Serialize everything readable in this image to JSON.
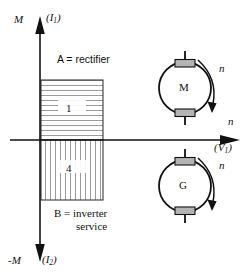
{
  "figure": {
    "type": "four-quadrant-operation-diagram",
    "background_color": "#ffffff",
    "stroke_color": "#111111",
    "hatch_color": "#9a9a9a",
    "terminal_fill": "#b4b4b4"
  },
  "axes": {
    "vertical_positive": {
      "symbol": "M",
      "paren": "(I",
      "subscript": "1",
      "paren_close": ")"
    },
    "vertical_negative": {
      "symbol": "-M",
      "paren": "(I",
      "subscript": "2",
      "paren_close": ")"
    },
    "horizontal_positive": {
      "symbol": "n",
      "paren": "(V",
      "subscript": "1",
      "paren_close": ")"
    }
  },
  "quadrants": [
    {
      "number": "1",
      "hatch": "horizontal",
      "caption_key": "rectifier"
    },
    {
      "number": "4",
      "hatch": "vertical",
      "caption_key": "inverter"
    }
  ],
  "captions": {
    "rectifier": "A = rectifier",
    "inverter_line1": "B = inverter",
    "inverter_line2": "service"
  },
  "machines": [
    {
      "letter": "M",
      "role": "motor",
      "rotation_label": "n",
      "rotation_direction": "clockwise"
    },
    {
      "letter": "G",
      "role": "generator",
      "rotation_label": "n",
      "rotation_direction": "clockwise"
    }
  ],
  "icons": {
    "arrow_up": "axis-arrow-up-icon",
    "arrow_down": "axis-arrow-down-icon",
    "arrow_right": "axis-arrow-right-icon",
    "rotation_arrow": "curved-rotation-arrow-icon",
    "machine_symbol": "rotating-machine-circle-icon",
    "terminal_block": "terminal-block-icon",
    "shaft_stub": "shaft-stub-icon"
  }
}
